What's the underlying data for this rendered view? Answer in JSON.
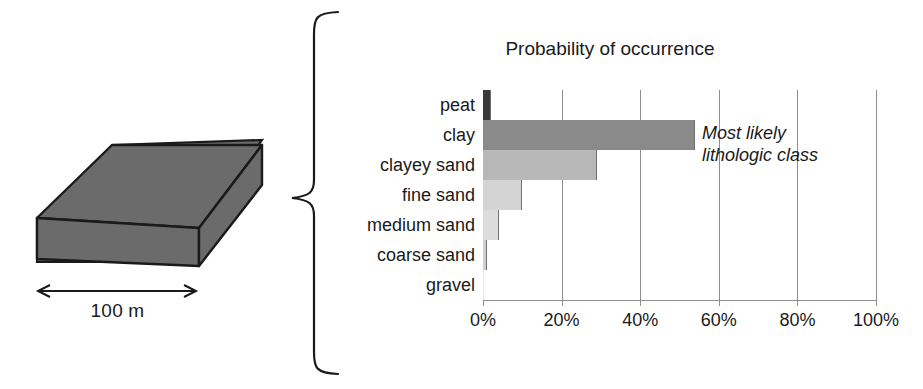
{
  "figure": {
    "block": {
      "scale_label": "100 m",
      "fill_color": "#6b6b6b",
      "edge_color": "#1a1a1a"
    },
    "brace_icon": "curly-brace-icon"
  },
  "chart_data": {
    "type": "bar",
    "orientation": "horizontal",
    "title": "Probability of occurrence",
    "xlabel": "",
    "ylabel": "",
    "categories": [
      "peat",
      "clay",
      "clayey sand",
      "fine sand",
      "medium sand",
      "coarse sand",
      "gravel"
    ],
    "values": [
      2,
      54,
      29,
      10,
      4,
      1,
      0
    ],
    "value_suffix": "%",
    "xlim": [
      0,
      100
    ],
    "xticks": [
      0,
      20,
      40,
      60,
      80,
      100
    ],
    "xtick_labels": [
      "0%",
      "20%",
      "40%",
      "60%",
      "80%",
      "100%"
    ],
    "grid": true,
    "legend": "none",
    "bar_colors": [
      "#3a3a3a",
      "#8a8a8a",
      "#b8b8b8",
      "#d4d4d4",
      "#dcdcdc",
      "#cfcfcf",
      "#e8e8e8"
    ],
    "annotations": [
      {
        "text_line1": "Most likely",
        "text_line2": "lithologic class",
        "style": "italic",
        "target_category": "clay"
      }
    ]
  }
}
